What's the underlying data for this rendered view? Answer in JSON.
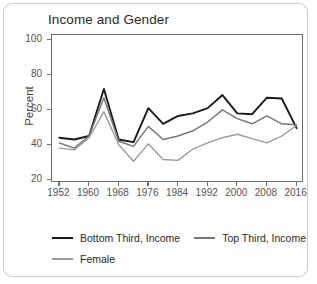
{
  "chart_data": {
    "type": "line",
    "title": "Income and Gender",
    "xlabel": "",
    "ylabel": "Percent",
    "xlim": [
      1950,
      2018
    ],
    "ylim": [
      18,
      103
    ],
    "grid": false,
    "legend_position": "bottom",
    "x": [
      1952,
      1956,
      1960,
      1964,
      1968,
      1972,
      1976,
      1980,
      1984,
      1988,
      1992,
      1996,
      2000,
      2004,
      2008,
      2012,
      2016
    ],
    "xticks": [
      1952,
      1960,
      1968,
      1976,
      1984,
      1992,
      2000,
      2008,
      2016
    ],
    "yticks": [
      20,
      40,
      60,
      80,
      100
    ],
    "series": [
      {
        "name": "Bottom Third, Income",
        "color": "#1a1a1a",
        "values": [
          44,
          43,
          45,
          72,
          43,
          41.5,
          61,
          52,
          56.5,
          58,
          61,
          68.5,
          58,
          57.5,
          67,
          66.5,
          49.5
        ]
      },
      {
        "name": "Top Third, Income",
        "color": "#777777",
        "values": [
          41,
          38,
          45,
          67,
          42,
          39,
          50.5,
          43,
          45,
          48,
          53,
          60,
          55,
          52,
          56.5,
          52,
          51.5
        ]
      },
      {
        "name": "Female",
        "color": "#9a9a9a",
        "values": [
          38,
          37,
          44,
          59,
          40,
          30.5,
          40.5,
          31.5,
          31,
          37.5,
          41,
          44,
          46,
          43.5,
          41,
          45,
          51
        ]
      }
    ]
  },
  "legend": {
    "entries": [
      {
        "label": "Bottom Third, Income"
      },
      {
        "label": "Top Third, Income"
      },
      {
        "label": "Female"
      }
    ]
  }
}
